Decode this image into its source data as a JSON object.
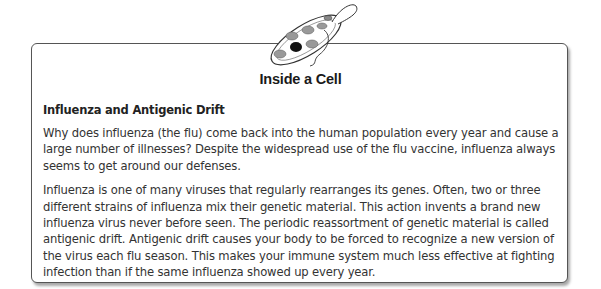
{
  "illustration": {
    "icon": "paramecium-cell-icon"
  },
  "sidebar_box": {
    "title": "Inside a Cell",
    "subheading": "Influenza and Antigenic Drift",
    "paragraphs": [
      "Why does influenza (the flu) come back into the human population every year and cause a large number of illnesses? Despite the widespread use of the flu vaccine, influenza always seems to get around our defenses.",
      "Influenza is one of many viruses that regularly rearranges its genes. Often, two or three different strains of influenza mix their genetic material. This action invents a brand new influenza virus never before seen. The periodic reassortment of genetic material is called antigenic drift. Antigenic drift causes your body to be forced to recognize a new version of the virus each flu season. This makes your immune system much less effective at fighting infection than if the same influenza showed up every year."
    ]
  }
}
